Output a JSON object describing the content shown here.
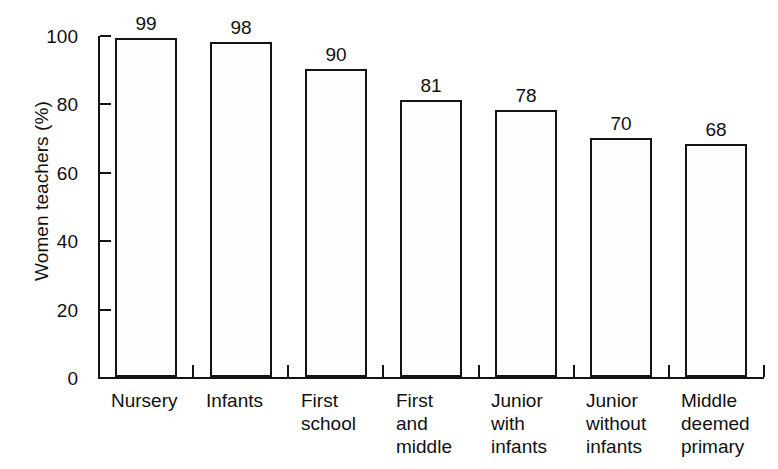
{
  "chart_data": {
    "type": "bar",
    "title": "",
    "xlabel": "",
    "ylabel": "Women teachers (%)",
    "categories": [
      "Nursery",
      "Infants",
      "First\nschool",
      "First\nand\nmiddle",
      "Junior\nwith\ninfants",
      "Junior\nwithout\ninfants",
      "Middle\ndeemed\nprimary"
    ],
    "values": [
      99,
      98,
      90,
      81,
      78,
      70,
      68
    ],
    "value_labels": [
      "99",
      "98",
      "90",
      "81",
      "78",
      "70",
      "68"
    ],
    "ylim": [
      0,
      100
    ],
    "yticks": [
      0,
      20,
      40,
      60,
      80,
      100
    ],
    "ytick_labels": [
      "0",
      "20",
      "40",
      "60",
      "80",
      "100"
    ],
    "grid": false,
    "legend": false,
    "bar_fill_color": "#fdfdfd",
    "bar_edge_color": "#141414",
    "axis_color": "#141414",
    "text_color": "#101010",
    "background_color": "#ffffff"
  }
}
